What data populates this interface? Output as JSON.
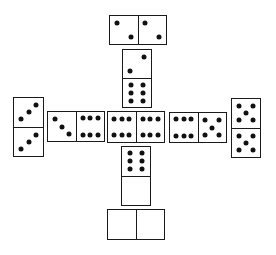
{
  "game": {
    "title": "Dominoes layout (Sebastopol / cross formation)",
    "pip_color": "#111111",
    "line_color": "#1a1a1a",
    "background": "#ffffff"
  },
  "dominoes": [
    {
      "id": "top-double-two",
      "orientation": "h",
      "x": 109,
      "y": 15,
      "w": 58,
      "h": 30,
      "ends": [
        2,
        2
      ]
    },
    {
      "id": "north-two-six",
      "orientation": "v",
      "x": 122,
      "y": 49,
      "w": 30,
      "h": 59,
      "ends": [
        2,
        6
      ]
    },
    {
      "id": "far-west-three-three",
      "orientation": "v",
      "x": 13,
      "y": 97,
      "w": 31,
      "h": 60,
      "ends": [
        3,
        3
      ]
    },
    {
      "id": "west-three-six",
      "orientation": "h",
      "x": 47,
      "y": 111,
      "w": 58,
      "h": 31,
      "ends": [
        3,
        6
      ]
    },
    {
      "id": "center-double-six",
      "orientation": "h",
      "x": 107,
      "y": 111,
      "w": 58,
      "h": 32,
      "ends": [
        6,
        6
      ]
    },
    {
      "id": "east-six-five",
      "orientation": "h",
      "x": 169,
      "y": 112,
      "w": 58,
      "h": 31,
      "ends": [
        6,
        5
      ]
    },
    {
      "id": "far-east-five-five",
      "orientation": "v",
      "x": 231,
      "y": 98,
      "w": 30,
      "h": 60,
      "ends": [
        5,
        5
      ]
    },
    {
      "id": "south-six-blank",
      "orientation": "v",
      "x": 121,
      "y": 146,
      "w": 30,
      "h": 60,
      "ends": [
        6,
        0
      ]
    },
    {
      "id": "bottom-double-blank",
      "orientation": "h",
      "x": 107,
      "y": 209,
      "w": 58,
      "h": 31,
      "ends": [
        0,
        0
      ]
    }
  ]
}
